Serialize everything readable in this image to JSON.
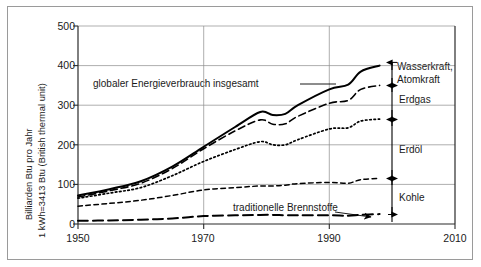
{
  "figure": {
    "y_axis_label_line1": "Billiarden Btu pro Jahr",
    "y_axis_label_line2": "1 kWh=3413 Btu (British thermal unit)"
  },
  "annotations": {
    "total": "globaler Energieverbrauch insgesamt",
    "traditional": "traditionelle Brennstoffe"
  },
  "side_labels": {
    "hydro_nuclear_line1": "Wasserkraft,",
    "hydro_nuclear_line2": "Atomkraft",
    "gas": "Erdgas",
    "oil": "Erdöl",
    "coal": "Kohle"
  },
  "ticks": {
    "y": [
      "0",
      "100",
      "200",
      "300",
      "400",
      "500"
    ],
    "x": [
      "1950",
      "1970",
      "1990",
      "2010"
    ]
  },
  "colors": {
    "line": "#000000",
    "grid": "#8c8c8c",
    "axis": "#3a3a3a",
    "frame": "#9a9a9a",
    "background": "#ffffff"
  },
  "chart_data": {
    "type": "line",
    "title": "",
    "subtitle": "",
    "xlabel": "",
    "ylabel": "Billiarden Btu pro Jahr  /  1 kWh=3413 Btu (British thermal unit)",
    "xlim": [
      1950,
      2010
    ],
    "ylim": [
      0,
      500
    ],
    "xticks": [
      1950,
      1970,
      1990,
      2010
    ],
    "yticks": [
      0,
      100,
      200,
      300,
      400,
      500
    ],
    "grid": true,
    "legend_position": "right-outside-band-labels",
    "note": "Cumulative (stacked) world energy consumption curves. Each curve is a running total; the band between two adjacent curves is the named energy source.",
    "x": [
      1950,
      1955,
      1960,
      1965,
      1970,
      1975,
      1979,
      1981,
      1983,
      1985,
      1990,
      1993,
      1995,
      1998
    ],
    "series": [
      {
        "name": "globaler Energieverbrauch insgesamt",
        "style": "solid",
        "values": [
          72,
          88,
          108,
          145,
          195,
          245,
          283,
          275,
          278,
          300,
          340,
          352,
          385,
          400
        ]
      },
      {
        "name": "+ Erdgas (kumuliert, ohne Wasserkraft/Atomkraft)",
        "style": "dashed",
        "values": [
          68,
          84,
          103,
          140,
          190,
          235,
          263,
          252,
          253,
          272,
          305,
          312,
          340,
          350
        ]
      },
      {
        "name": "+ Erdöl (kumuliert, ohne Erdgas)",
        "style": "dotted",
        "values": [
          65,
          78,
          92,
          122,
          158,
          188,
          208,
          200,
          200,
          213,
          240,
          243,
          260,
          265
        ]
      },
      {
        "name": "+ Kohle (kumuliert, ohne Erdöl)",
        "style": "shortdash",
        "values": [
          45,
          52,
          60,
          72,
          86,
          92,
          96,
          96,
          98,
          102,
          105,
          103,
          112,
          115
        ]
      },
      {
        "name": "traditionelle Brennstoffe",
        "style": "longdash",
        "values": [
          8,
          9,
          11,
          14,
          20,
          22,
          23,
          23,
          22,
          22,
          22,
          21,
          23,
          25
        ]
      }
    ],
    "bands": [
      {
        "label": "Wasserkraft, Atomkraft",
        "from_series": "+ Erdgas (kumuliert, ohne Wasserkraft/Atomkraft)",
        "to_series": "globaler Energieverbrauch insgesamt",
        "value_1998": 50
      },
      {
        "label": "Erdgas",
        "from_series": "+ Erdöl (kumuliert, ohne Erdgas)",
        "to_series": "+ Erdgas (kumuliert, ohne Wasserkraft/Atomkraft)",
        "value_1998": 85
      },
      {
        "label": "Erdöl",
        "from_series": "+ Kohle (kumuliert, ohne Erdöl)",
        "to_series": "+ Erdöl (kumuliert, ohne Erdgas)",
        "value_1998": 150
      },
      {
        "label": "Kohle",
        "from_series": "traditionelle Brennstoffe",
        "to_series": "+ Kohle (kumuliert, ohne Erdöl)",
        "value_1998": 90
      }
    ]
  }
}
